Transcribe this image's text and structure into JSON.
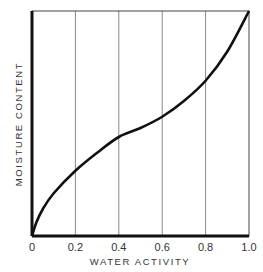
{
  "chart_data": {
    "type": "line",
    "title": "",
    "xlabel": "WATER ACTIVITY",
    "ylabel": "MOISTURE CONTENT",
    "xlim": [
      0,
      1.0
    ],
    "ylim": [
      0,
      1.0
    ],
    "x_ticks": [
      "0",
      "0.2",
      "0.4",
      "0.6",
      "0.8",
      "1.0"
    ],
    "y_ticks": [],
    "grid": "vertical",
    "legend": "none",
    "series": [
      {
        "name": "Sorption isotherm",
        "x": [
          0,
          0.02,
          0.05,
          0.1,
          0.2,
          0.3,
          0.4,
          0.5,
          0.6,
          0.7,
          0.8,
          0.9,
          1.0
        ],
        "values": [
          0,
          0.06,
          0.12,
          0.19,
          0.29,
          0.37,
          0.44,
          0.48,
          0.53,
          0.6,
          0.69,
          0.82,
          1.0
        ]
      }
    ]
  },
  "colors": {
    "line": "#111111",
    "grid": "#888888",
    "frame": "#222222"
  }
}
